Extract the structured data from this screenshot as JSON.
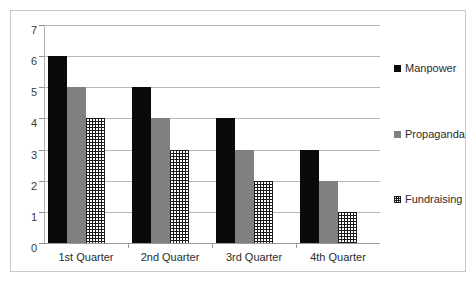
{
  "chart_data": {
    "type": "bar",
    "title": "",
    "subtitle": "",
    "xlabel": "",
    "ylabel": "",
    "categories": [
      "1st Quarter",
      "2nd Quarter",
      "3rd Quarter",
      "4th Quarter"
    ],
    "series": [
      {
        "name": "Manpower",
        "values": [
          6,
          5,
          4,
          3
        ],
        "color": "#0a0a0a",
        "fill": "solid-black"
      },
      {
        "name": "Propaganda",
        "values": [
          5,
          4,
          3,
          2
        ],
        "color": "#808080",
        "fill": "solid-gray"
      },
      {
        "name": "Fundraising",
        "values": [
          4,
          3,
          2,
          1
        ],
        "color": "#1a1a1a",
        "fill": "crosshatch"
      }
    ],
    "ylim": [
      0,
      7
    ],
    "yticks": [
      0,
      1,
      2,
      3,
      4,
      5,
      6,
      7
    ],
    "ytick_labels": [
      "0",
      "1",
      "2",
      "3",
      "4",
      "5",
      "6",
      "7"
    ],
    "grid": true,
    "grid_axis": "y",
    "legend_position": "right",
    "legend_entries": [
      "Manpower",
      "Propaganda",
      "Fundraising"
    ],
    "annotations": []
  },
  "frame": {
    "border_color": "#c8c8c8",
    "background": "#ffffff"
  }
}
